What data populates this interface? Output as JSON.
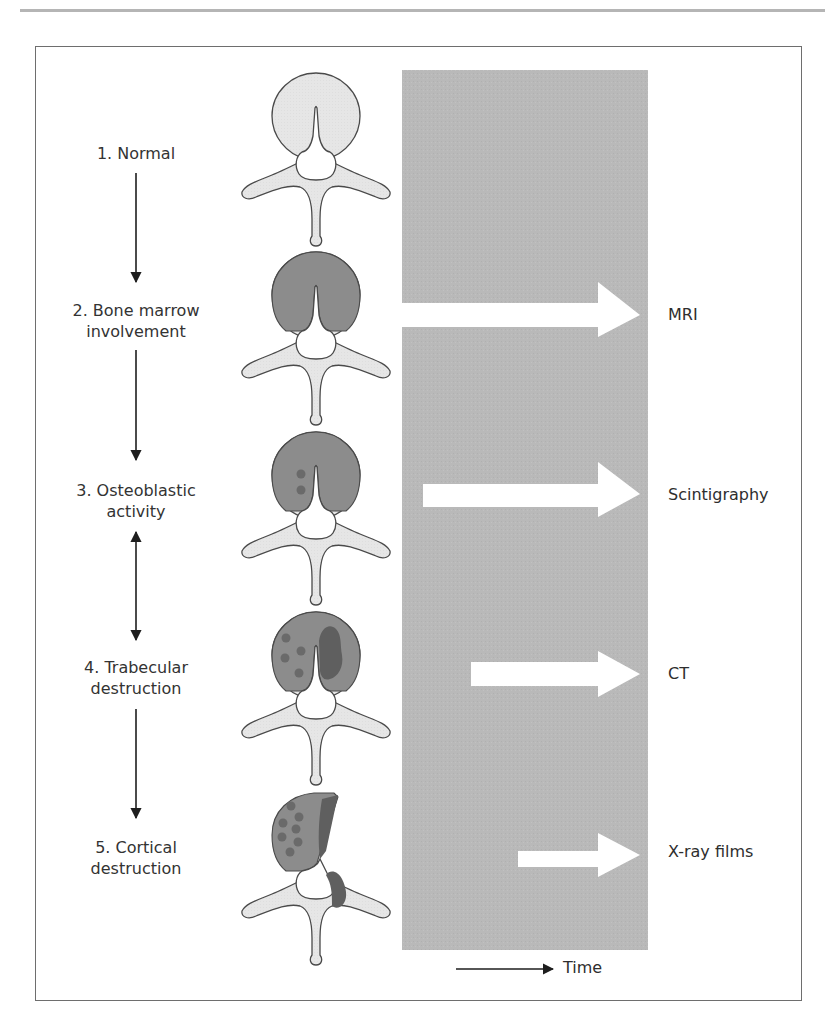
{
  "figure": {
    "stages": [
      {
        "number": "1",
        "line1": "1. Normal",
        "line2": ""
      },
      {
        "number": "2",
        "line1": "2. Bone marrow",
        "line2": "involvement"
      },
      {
        "number": "3",
        "line1": "3. Osteoblastic",
        "line2": "activity"
      },
      {
        "number": "4",
        "line1": "4. Trabecular",
        "line2": "destruction"
      },
      {
        "number": "5",
        "line1": "5. Cortical",
        "line2": "destruction"
      }
    ],
    "stage_connectors": [
      {
        "from": "1",
        "to": "2",
        "type": "arrow-down"
      },
      {
        "from": "2",
        "to": "3",
        "type": "arrow-down"
      },
      {
        "from": "3",
        "to": "4",
        "type": "double-arrow"
      },
      {
        "from": "4",
        "to": "5",
        "type": "arrow-down"
      }
    ],
    "detection_methods": [
      {
        "label": "MRI",
        "stage": "2"
      },
      {
        "label": "Scintigraphy",
        "stage": "3"
      },
      {
        "label": "CT",
        "stage": "4"
      },
      {
        "label": "X-ray films",
        "stage": "5"
      }
    ],
    "time_axis": {
      "label": "Time",
      "icon": "right-arrow-icon"
    },
    "colors": {
      "panel": "#b9b9b9",
      "bone_light": "#e6e6e6",
      "marrow": "#8c8c8c",
      "lesion_dot": "#6f6f6f",
      "destruction": "#5f5f5f",
      "outline": "#4a4a4a",
      "frame": "#6e6e6e"
    }
  }
}
